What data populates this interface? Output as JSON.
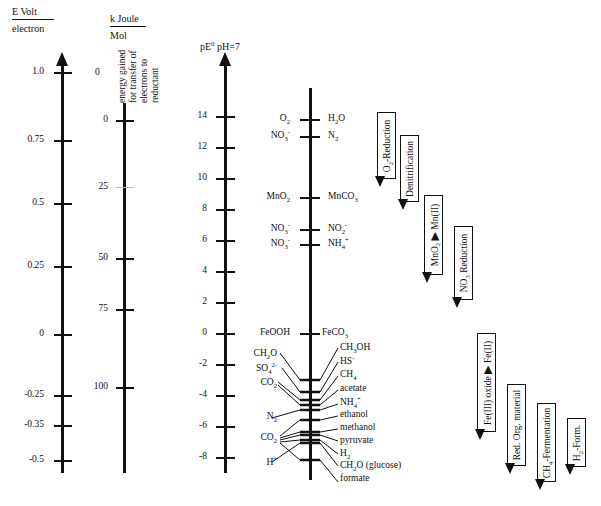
{
  "axes": {
    "evolt": {
      "header_top": "E Volt",
      "header_bottom": "electron",
      "ticks": [
        {
          "label": "1.0",
          "y": 72
        },
        {
          "label": "0.75",
          "y": 140
        },
        {
          "label": "0.5",
          "y": 203
        },
        {
          "label": "0.25",
          "y": 266
        },
        {
          "label": "0",
          "y": 334
        },
        {
          "label": "-0.25",
          "y": 395
        },
        {
          "label": "-0.35",
          "y": 425
        },
        {
          "label": "-0.5",
          "y": 460
        }
      ]
    },
    "kjoule": {
      "header_top": "k Joule",
      "header_bottom": "Mol",
      "caption_lines": [
        "energy gained",
        "for transfer of",
        "electrons to",
        "reductant"
      ],
      "top_label": "0",
      "ticks": [
        {
          "label": "0",
          "y": 120
        },
        {
          "label": "25",
          "y": 187
        },
        {
          "label": "50",
          "y": 258
        },
        {
          "label": "75",
          "y": 309
        },
        {
          "label": "100",
          "y": 387
        }
      ]
    },
    "pe": {
      "header": "pE",
      "header_sup": "0",
      "header_suffix": " pH=7",
      "ticks": [
        {
          "label": "14",
          "y": 116
        },
        {
          "label": "12",
          "y": 147
        },
        {
          "label": "10",
          "y": 178
        },
        {
          "label": "8",
          "y": 209
        },
        {
          "label": "6",
          "y": 240
        },
        {
          "label": "4",
          "y": 271
        },
        {
          "label": "2",
          "y": 302
        },
        {
          "label": "0",
          "y": 333
        },
        {
          "label": "-2",
          "y": 364
        },
        {
          "label": "-4",
          "y": 395
        },
        {
          "label": "-6",
          "y": 426
        },
        {
          "label": "-8",
          "y": 457
        }
      ]
    }
  },
  "couples_upper": [
    {
      "oxidant": "O2",
      "reductant": "H2O",
      "y": 119
    },
    {
      "oxidant": "NO3-",
      "reductant": "N2",
      "y": 136
    },
    {
      "oxidant": "MnO2",
      "reductant": "MnCO3",
      "y": 197
    },
    {
      "oxidant": "NO3-",
      "reductant": "NO2-",
      "y": 229
    },
    {
      "oxidant": "NO3-",
      "reductant": "NH4+",
      "y": 244
    },
    {
      "oxidant": "FeOOH",
      "reductant": "FeCO3",
      "y": 333
    }
  ],
  "oxidants_lower": [
    {
      "label": "CH2O",
      "y": 354
    },
    {
      "label": "SO4 2-",
      "y": 369
    },
    {
      "label": "CO2",
      "y": 383
    },
    {
      "label": "N2",
      "y": 417
    },
    {
      "label": "CO2",
      "y": 438
    },
    {
      "label": "H+",
      "y": 463
    }
  ],
  "reductants_lower": [
    {
      "label": "CH3OH",
      "y": 348
    },
    {
      "label": "HS-",
      "y": 362
    },
    {
      "label": "CH4",
      "y": 375
    },
    {
      "label": "acetate",
      "y": 389
    },
    {
      "label": "NH4+",
      "y": 403
    },
    {
      "label": "ethanol",
      "y": 415
    },
    {
      "label": "methanol",
      "y": 428
    },
    {
      "label": "pyruvate",
      "y": 441
    },
    {
      "label": "H2",
      "y": 454
    },
    {
      "label": "CH2O (glucose)",
      "y": 466
    },
    {
      "label": "formate",
      "y": 479
    }
  ],
  "processes": [
    {
      "label": "O2-Reduction",
      "x": 377,
      "top": 112,
      "height": 65
    },
    {
      "label": "Denitrification",
      "x": 400,
      "top": 135,
      "height": 65
    },
    {
      "label": "MnO2 → Mn(II)",
      "x": 424,
      "top": 195,
      "height": 78
    },
    {
      "label": "NO3 Reduction",
      "x": 454,
      "top": 226,
      "height": 72
    },
    {
      "label": "Fe(III) oxide → Fe(II)",
      "x": 477,
      "top": 333,
      "height": 97
    },
    {
      "label": "Red. Org. material",
      "x": 507,
      "top": 384,
      "height": 80
    },
    {
      "label": "CH4-Fermentation",
      "x": 537,
      "top": 403,
      "height": 77
    },
    {
      "label": "H2-Form.",
      "x": 567,
      "top": 418,
      "height": 47
    }
  ]
}
